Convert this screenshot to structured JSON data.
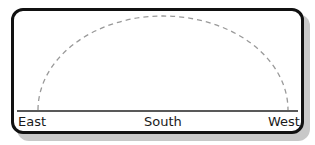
{
  "diagram": {
    "labels": {
      "east": "East",
      "south": "South",
      "west": "West"
    },
    "colors": {
      "border": "#111111",
      "shadow": "#c8c8c8",
      "horizon": "#222222",
      "arc": "#999999"
    },
    "arc_style": "dashed"
  }
}
